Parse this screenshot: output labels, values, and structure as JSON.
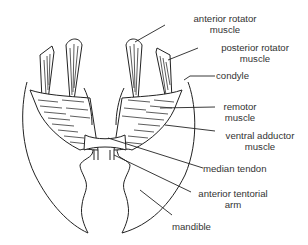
{
  "diagram": {
    "type": "anatomical illustration",
    "labels": [
      {
        "id": "anterior-rotator-muscle",
        "line1": "anterior rotator",
        "line2": "muscle"
      },
      {
        "id": "posterior-rotator-muscle",
        "line1": "posterior rotator",
        "line2": "muscle"
      },
      {
        "id": "condyle",
        "line1": "condyle",
        "line2": ""
      },
      {
        "id": "remotor-muscle",
        "line1": "remotor",
        "line2": "muscle"
      },
      {
        "id": "ventral-adductor-muscle",
        "line1": "ventral adductor",
        "line2": "muscle"
      },
      {
        "id": "median-tendon",
        "line1": "median tendon",
        "line2": ""
      },
      {
        "id": "anterior-tentorial-arm",
        "line1": "anterior tentorial",
        "line2": "arm"
      },
      {
        "id": "mandible",
        "line1": "mandible",
        "line2": ""
      }
    ],
    "colors": {
      "line": "#222222",
      "text": "#333333",
      "background": "#ffffff"
    }
  }
}
